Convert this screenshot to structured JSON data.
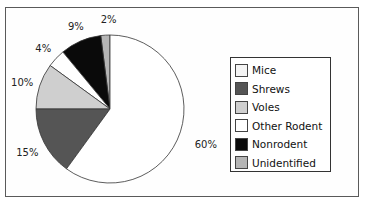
{
  "chart_data": {
    "type": "pie",
    "title": "",
    "categories": [
      "Mice",
      "Shrews",
      "Voles",
      "Other Rodent",
      "Nonrodent",
      "Unidentified"
    ],
    "values": [
      60,
      15,
      10,
      4,
      9,
      2
    ],
    "labels": [
      "60%",
      "15%",
      "10%",
      "4%",
      "9%",
      "2%"
    ],
    "colors": [
      "#ffffff",
      "#555555",
      "#cfcfcf",
      "#ffffff",
      "#0a0a0a",
      "#b5b5b5"
    ],
    "legend_position": "right",
    "start_angle": "12 o'clock, clockwise",
    "unit": "%"
  },
  "legend": {
    "items": [
      {
        "label": "Mice",
        "color": "#f4f4f4"
      },
      {
        "label": "Shrews",
        "color": "#555555"
      },
      {
        "label": "Voles",
        "color": "#cfcfcf"
      },
      {
        "label": "Other Rodent",
        "color": "#ffffff"
      },
      {
        "label": "Nonrodent",
        "color": "#0a0a0a"
      },
      {
        "label": "Unidentified",
        "color": "#b5b5b5"
      }
    ]
  }
}
